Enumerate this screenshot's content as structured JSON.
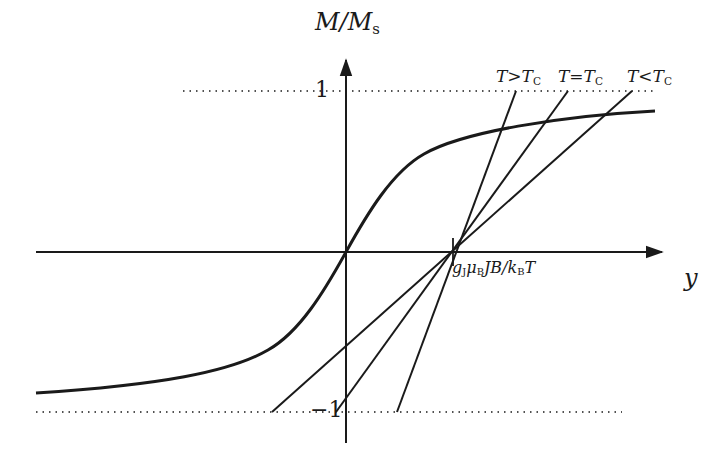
{
  "figure": {
    "type": "Brillouin/mean-field magnetization graphical solution",
    "y_axis_label": {
      "main": "M/M",
      "sub": "s"
    },
    "x_axis_label": "y",
    "ticks": {
      "top": "1",
      "bottom": "−1"
    },
    "intersection_label": {
      "g": "g",
      "gsub": "J",
      "mu": "μ",
      "musub": "B",
      "mid": "JB/k",
      "ksub": "B",
      "end": "T"
    },
    "lines": [
      {
        "id": "gt",
        "label_T": "T",
        "label_rel": ">",
        "label_Tc": "T",
        "label_Tc_sub": "C"
      },
      {
        "id": "eq",
        "label_T": "T",
        "label_rel": "=",
        "label_Tc": "T",
        "label_Tc_sub": "C"
      },
      {
        "id": "lt",
        "label_T": "T",
        "label_rel": "<",
        "label_Tc": "T",
        "label_Tc_sub": "C"
      }
    ],
    "colors": {
      "ink": "#1a1a1a",
      "background": "#ffffff"
    }
  }
}
